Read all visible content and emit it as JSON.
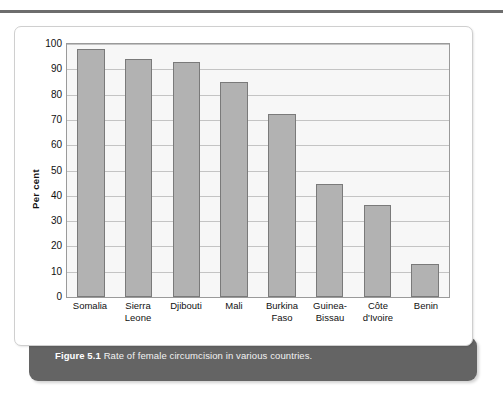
{
  "figure": {
    "caption_label": "Figure 5.1",
    "caption_text": "Rate of female circumcision in various countries."
  },
  "colors": {
    "bar_fill": "#b2b2b2",
    "bar_border": "#7a7a7a",
    "plot_background": "#f7f7f7",
    "gridline": "#c4c4c4",
    "caption_bar": "#646464",
    "card_background": "#ffffff"
  },
  "chart_data": {
    "type": "bar",
    "title": "",
    "xlabel": "",
    "ylabel": "Per cent",
    "ylim": [
      0,
      100
    ],
    "ytick_step": 10,
    "yticks": [
      100,
      90,
      80,
      70,
      60,
      50,
      40,
      30,
      20,
      10,
      0
    ],
    "grid": true,
    "legend": false,
    "categories": [
      "Somalia",
      "Sierra Leone",
      "Djibouti",
      "Mali",
      "Burkina Faso",
      "Guinea-Bissau",
      "Côte d'Ivoire",
      "Benin"
    ],
    "category_lines": [
      [
        "Somalia"
      ],
      [
        "Sierra",
        "Leone"
      ],
      [
        "Djibouti"
      ],
      [
        "Mali"
      ],
      [
        "Burkina",
        "Faso"
      ],
      [
        "Guinea-",
        "Bissau"
      ],
      [
        "Côte",
        "d'Ivoire"
      ],
      [
        "Benin"
      ]
    ],
    "values": [
      98,
      94,
      93,
      85,
      72.5,
      44.5,
      36.5,
      13
    ]
  }
}
